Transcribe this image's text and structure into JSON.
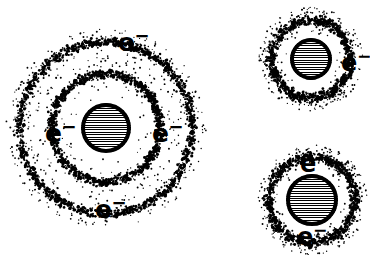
{
  "figure": {
    "background_color": "#ffffff",
    "ink_color": "#000000",
    "width": 370,
    "height": 255
  },
  "atoms": [
    {
      "id": "large-atom",
      "name": "large-atom-two-shells",
      "center_x": 106,
      "center_y": 128,
      "nucleus_radius": 25,
      "shells": [
        {
          "name": "inner-shell",
          "radius": 54,
          "band_width": 11,
          "density": 900
        },
        {
          "name": "outer-shell",
          "radius": 86,
          "band_width": 12,
          "density": 1050
        }
      ],
      "scatter": {
        "inner_radius": 30,
        "outer_radius": 100,
        "density": 620
      },
      "labels": [
        {
          "name": "electron-label-top",
          "text_e": "e",
          "text_charge": "−",
          "x": 118,
          "y": 27,
          "size": 25
        },
        {
          "name": "electron-label-left",
          "text_e": "e",
          "text_charge": "−",
          "x": 45,
          "y": 118,
          "size": 25
        },
        {
          "name": "electron-label-right",
          "text_e": "e",
          "text_charge": "−",
          "x": 152,
          "y": 118,
          "size": 25
        },
        {
          "name": "electron-label-bottom",
          "text_e": "e",
          "text_charge": "−",
          "x": 95,
          "y": 194,
          "size": 25
        }
      ]
    },
    {
      "id": "top-right-atom",
      "name": "small-atom-top-right",
      "center_x": 311,
      "center_y": 59,
      "nucleus_radius": 21,
      "shells": [
        {
          "name": "single-shell",
          "radius": 39,
          "band_width": 12,
          "density": 720
        }
      ],
      "scatter": {
        "inner_radius": 24,
        "outer_radius": 52,
        "density": 300
      },
      "labels": [
        {
          "name": "electron-label-right",
          "text_e": "e",
          "text_charge": "−",
          "x": 341,
          "y": 48,
          "size": 24
        }
      ]
    },
    {
      "id": "bottom-right-atom",
      "name": "small-atom-bottom-right",
      "center_x": 312,
      "center_y": 200,
      "nucleus_radius": 26,
      "shells": [
        {
          "name": "single-shell",
          "radius": 43,
          "band_width": 12,
          "density": 740
        }
      ],
      "scatter": {
        "inner_radius": 29,
        "outer_radius": 55,
        "density": 300
      },
      "labels": [
        {
          "name": "electron-label-top",
          "text_e": "e",
          "text_charge": "−",
          "x": 300,
          "y": 149,
          "size": 24
        },
        {
          "name": "electron-label-bottom",
          "text_e": "e",
          "text_charge": "−",
          "x": 297,
          "y": 222,
          "size": 24
        }
      ]
    }
  ]
}
